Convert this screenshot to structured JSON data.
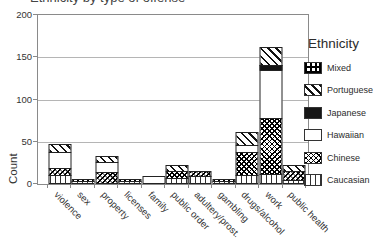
{
  "title": {
    "text": "Ethnicity by type of offense"
  },
  "y_axis": {
    "label": "Count",
    "ticks": [
      200,
      150,
      100,
      50,
      0
    ]
  },
  "x_axis": {
    "categories": [
      "violence",
      "sex",
      "property",
      "licenses",
      "family",
      "public order",
      "adultery/prost.",
      "gambling",
      "drugs/alcohol",
      "work",
      "public health"
    ]
  },
  "legend": {
    "title": "Ethnicity",
    "items": [
      {
        "label": "Mixed",
        "pattern": "grid"
      },
      {
        "label": "Portuguese",
        "pattern": "diag"
      },
      {
        "label": "Japanese",
        "pattern": "solid"
      },
      {
        "label": "Hawaiian",
        "pattern": "plain"
      },
      {
        "label": "Chinese",
        "pattern": "cross"
      },
      {
        "label": "Caucasian",
        "pattern": "vlines"
      }
    ]
  },
  "chart_data": {
    "type": "bar",
    "stacked": true,
    "title": "Ethnicity by type of offense",
    "categories": [
      "violence",
      "sex",
      "property",
      "licenses",
      "family",
      "public order",
      "adultery/prost.",
      "gambling",
      "drugs/alcohol",
      "work",
      "public health"
    ],
    "series": [
      {
        "name": "Caucasian",
        "pattern": "vlines",
        "values": [
          8,
          1,
          0,
          1,
          0,
          5,
          7,
          1,
          8,
          10,
          2
        ]
      },
      {
        "name": "Chinese",
        "pattern": "cross",
        "values": [
          8,
          1,
          12,
          1,
          0,
          7,
          5,
          1,
          26,
          65,
          10
        ]
      },
      {
        "name": "Hawaiian",
        "pattern": "plain",
        "values": [
          17,
          0,
          10,
          0,
          7,
          0,
          0,
          0,
          8,
          55,
          0
        ]
      },
      {
        "name": "Japanese",
        "pattern": "solid",
        "values": [
          0,
          0,
          0,
          0,
          0,
          0,
          0,
          0,
          0,
          5,
          0
        ]
      },
      {
        "name": "Portuguese",
        "pattern": "diag",
        "values": [
          9,
          0,
          7,
          0,
          0,
          6,
          0,
          0,
          14,
          20,
          6
        ]
      },
      {
        "name": "Mixed",
        "pattern": "grid",
        "values": [
          0,
          0,
          0,
          0,
          0,
          0,
          0,
          0,
          0,
          0,
          0
        ]
      }
    ],
    "totals": [
      42,
      2,
      29,
      2,
      7,
      18,
      12,
      2,
      56,
      155,
      18
    ],
    "ylabel": "Count",
    "ylim": [
      0,
      200
    ],
    "grid": true,
    "legend_position": "right"
  }
}
